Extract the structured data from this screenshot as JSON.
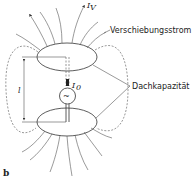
{
  "figure": {
    "panel_label": "b",
    "labels": {
      "displacement_current": "Verschiebungsstrom",
      "top_capacitance": "Dachkapazität",
      "current_v": "I",
      "current_v_sub": "V",
      "current_0": "I",
      "current_0_sub": "0",
      "length": "l"
    },
    "source_symbol": "~",
    "colors": {
      "line": "#333333",
      "background": "#ffffff"
    }
  }
}
